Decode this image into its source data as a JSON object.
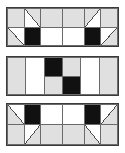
{
  "figure": {
    "background_color": "#ffffff",
    "width": 125,
    "height": 153,
    "palette": {
      "light": "#e0e0e0",
      "white": "#ffffff",
      "dark": "#111111",
      "seam": "#6b6b6b",
      "border": "#3a3a3a"
    }
  },
  "panels": [
    {
      "id": "panel-top",
      "label": "Top strip",
      "x": 6,
      "y": 7,
      "width": 113,
      "height": 40,
      "columns": 6,
      "rows": 2,
      "column_widths": [
        1,
        1,
        1.35,
        1.35,
        1,
        1
      ],
      "cells": [
        {
          "r": 0,
          "c": 0,
          "base": "gray",
          "tri": null,
          "tri_color": null
        },
        {
          "r": 0,
          "c": 1,
          "base": "white",
          "tri": "tri-tr",
          "tri_color": "#e0e0e0"
        },
        {
          "r": 0,
          "c": 2,
          "base": "gray",
          "tri": null,
          "tri_color": null
        },
        {
          "r": 0,
          "c": 3,
          "base": "gray",
          "tri": null,
          "tri_color": null
        },
        {
          "r": 0,
          "c": 4,
          "base": "white",
          "tri": "tri-tl",
          "tri_color": "#e0e0e0"
        },
        {
          "r": 0,
          "c": 5,
          "base": "gray",
          "tri": null,
          "tri_color": null
        },
        {
          "r": 1,
          "c": 0,
          "base": "white",
          "tri": "tri-bl",
          "tri_color": "#e0e0e0"
        },
        {
          "r": 1,
          "c": 1,
          "base": "black",
          "tri": null,
          "tri_color": null
        },
        {
          "r": 1,
          "c": 2,
          "base": "white",
          "tri": null,
          "tri_color": null
        },
        {
          "r": 1,
          "c": 3,
          "base": "white",
          "tri": null,
          "tri_color": null
        },
        {
          "r": 1,
          "c": 4,
          "base": "black",
          "tri": null,
          "tri_color": null
        },
        {
          "r": 1,
          "c": 5,
          "base": "white",
          "tri": "tri-br",
          "tri_color": "#e0e0e0"
        }
      ]
    },
    {
      "id": "panel-middle",
      "label": "Middle strip",
      "x": 6,
      "y": 56,
      "width": 113,
      "height": 40,
      "columns": 6,
      "rows": 2,
      "column_widths": [
        1,
        1,
        1,
        1,
        1,
        1
      ],
      "cells": [
        {
          "r": 0,
          "c": 0,
          "base": "gray",
          "tri": null,
          "tri_color": null,
          "span": 2
        },
        {
          "r": 0,
          "c": 1,
          "base": "white",
          "tri": null,
          "tri_color": null,
          "span": 2
        },
        {
          "r": 0,
          "c": 2,
          "base": "black",
          "tri": null,
          "tri_color": null
        },
        {
          "r": 0,
          "c": 3,
          "base": "gray",
          "tri": null,
          "tri_color": null
        },
        {
          "r": 0,
          "c": 4,
          "base": "white",
          "tri": null,
          "tri_color": null,
          "span": 2
        },
        {
          "r": 0,
          "c": 5,
          "base": "gray",
          "tri": null,
          "tri_color": null,
          "span": 2
        },
        {
          "r": 1,
          "c": 2,
          "base": "gray",
          "tri": null,
          "tri_color": null
        },
        {
          "r": 1,
          "c": 3,
          "base": "black",
          "tri": null,
          "tri_color": null
        }
      ]
    },
    {
      "id": "panel-bottom",
      "label": "Bottom strip",
      "x": 6,
      "y": 103,
      "width": 113,
      "height": 43,
      "columns": 6,
      "rows": 2,
      "column_widths": [
        1,
        1,
        1.35,
        1.35,
        1,
        1
      ],
      "cells": [
        {
          "r": 0,
          "c": 0,
          "base": "white",
          "tri": "tri-bl",
          "tri_color": "#e0e0e0"
        },
        {
          "r": 0,
          "c": 1,
          "base": "black",
          "tri": null,
          "tri_color": null
        },
        {
          "r": 0,
          "c": 2,
          "base": "white",
          "tri": null,
          "tri_color": null
        },
        {
          "r": 0,
          "c": 3,
          "base": "white",
          "tri": null,
          "tri_color": null
        },
        {
          "r": 0,
          "c": 4,
          "base": "black",
          "tri": null,
          "tri_color": null
        },
        {
          "r": 0,
          "c": 5,
          "base": "white",
          "tri": "tri-br",
          "tri_color": "#e0e0e0"
        },
        {
          "r": 1,
          "c": 0,
          "base": "gray",
          "tri": null,
          "tri_color": null
        },
        {
          "r": 1,
          "c": 1,
          "base": "white",
          "tri": "tri-br",
          "tri_color": "#e0e0e0"
        },
        {
          "r": 1,
          "c": 2,
          "base": "gray",
          "tri": null,
          "tri_color": null
        },
        {
          "r": 1,
          "c": 3,
          "base": "gray",
          "tri": null,
          "tri_color": null
        },
        {
          "r": 1,
          "c": 4,
          "base": "white",
          "tri": "tri-bl",
          "tri_color": "#e0e0e0"
        },
        {
          "r": 1,
          "c": 5,
          "base": "gray",
          "tri": null,
          "tri_color": null
        }
      ]
    }
  ]
}
